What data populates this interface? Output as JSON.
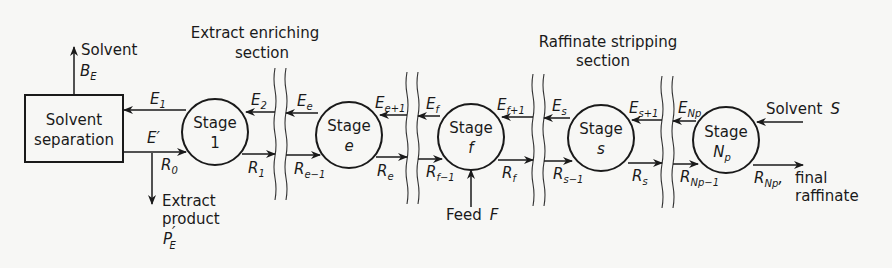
{
  "diagram": {
    "type": "countercurrent-extraction-cascade",
    "separator": {
      "line1": "Solvent",
      "line2": "separation"
    },
    "solvent_out": {
      "label": "Solvent",
      "symbol": "B",
      "sub": "E"
    },
    "extract_product": {
      "line1": "Extract",
      "line2": "product",
      "symbol": "P",
      "prime": "′",
      "sub": "E"
    },
    "E_prime": "E′",
    "R0": {
      "symbol": "R",
      "sub": "0"
    },
    "sections": [
      {
        "line1": "Extract enriching",
        "line2": "section"
      },
      {
        "line1": "Raffinate stripping",
        "line2": "section"
      }
    ],
    "stages": [
      {
        "word": "Stage",
        "id": "1",
        "E_in": {
          "symbol": "E",
          "sub": "2"
        },
        "E_out": {
          "symbol": "E",
          "sub": "1"
        },
        "R_in": {
          "symbol": "R",
          "sub": "0"
        },
        "R_out": {
          "symbol": "R",
          "sub": "1"
        }
      },
      {
        "word": "Stage",
        "id": "e",
        "E_in": {
          "symbol": "E",
          "sub": "e+1"
        },
        "E_out": {
          "symbol": "E",
          "sub": "e"
        },
        "R_in": {
          "symbol": "R",
          "sub": "e−1"
        },
        "R_out": {
          "symbol": "R",
          "sub": "e"
        }
      },
      {
        "word": "Stage",
        "id": "f",
        "E_in": {
          "symbol": "E",
          "sub": "f+1"
        },
        "E_out": {
          "symbol": "E",
          "sub": "f"
        },
        "R_in": {
          "symbol": "R",
          "sub": "f−1"
        },
        "R_out": {
          "symbol": "R",
          "sub": "f"
        }
      },
      {
        "word": "Stage",
        "id": "s",
        "E_in": {
          "symbol": "E",
          "sub": "s+1"
        },
        "E_out": {
          "symbol": "E",
          "sub": "s"
        },
        "R_in": {
          "symbol": "R",
          "sub": "s−1"
        },
        "R_out": {
          "symbol": "R",
          "sub": "s"
        }
      },
      {
        "word": "Stage",
        "id": "Np",
        "E_out": {
          "symbol": "E",
          "sub": "Np"
        },
        "R_in": {
          "symbol": "R",
          "sub": "Np−1"
        },
        "R_out": {
          "symbol": "R",
          "sub": "Np"
        }
      }
    ],
    "feed": {
      "label": "Feed",
      "symbol": "F"
    },
    "solvent_in": {
      "label": "Solvent",
      "symbol": "S"
    },
    "final_raffinate": {
      "comma": ",",
      "line1": "final",
      "line2": "raffinate"
    }
  }
}
